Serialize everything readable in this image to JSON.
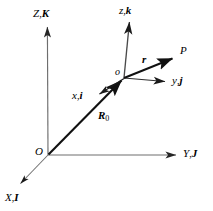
{
  "figure": {
    "type": "vector-diagram",
    "colors": {
      "stroke": "#1a1a1a",
      "axis_gray": "#6e6e6e",
      "background": "#ffffff",
      "text": "#000000"
    },
    "labels": {
      "global_z": {
        "symbol": "Z",
        "comma": ",",
        "unit_vector": "K",
        "text": "Z,K"
      },
      "global_y": {
        "symbol": "Y",
        "comma": ",",
        "unit_vector": "J",
        "text": "Y,J"
      },
      "global_x": {
        "symbol": "X",
        "comma": ",",
        "unit_vector": "I",
        "text": "X,I"
      },
      "global_origin": {
        "text": "O"
      },
      "local_z": {
        "symbol": "z",
        "comma": ",",
        "unit_vector": "k",
        "text": "z,k"
      },
      "local_y": {
        "symbol": "y",
        "comma": ",",
        "unit_vector": "j",
        "text": "y,j"
      },
      "local_x": {
        "symbol": "x",
        "comma": ",",
        "unit_vector": "i",
        "text": "x,i"
      },
      "local_origin": {
        "text": "o"
      },
      "point": {
        "text": "P"
      },
      "vector_r": {
        "text": "r"
      },
      "vector_R0": {
        "symbol": "R",
        "subscript": "0",
        "text": "R0"
      }
    },
    "geometry": {
      "global_origin_px": [
        48,
        155
      ],
      "local_origin_px": [
        124,
        78
      ],
      "point_P_px": [
        176,
        57
      ],
      "global_z_tip_px": [
        47,
        25
      ],
      "global_y_tip_px": [
        178,
        155
      ],
      "global_x_tip_px": [
        18,
        186
      ],
      "local_z_tip_px": [
        130,
        20
      ],
      "local_y_tip_px": [
        168,
        82
      ],
      "local_x_tip_px": [
        96,
        96
      ]
    }
  }
}
